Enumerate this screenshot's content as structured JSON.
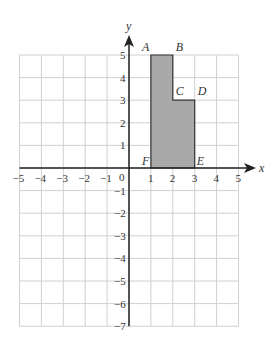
{
  "diagram": {
    "type": "coordinate-grid",
    "x_axis": {
      "label": "x",
      "min": -5,
      "max": 5,
      "ticks": [
        "-5",
        "-4",
        "-3",
        "-2",
        "-1",
        "1",
        "2",
        "3",
        "4",
        "5"
      ]
    },
    "y_axis": {
      "label": "y",
      "min": -7,
      "max": 5,
      "ticks": [
        "5",
        "4",
        "3",
        "2",
        "1",
        "-1",
        "-2",
        "-3",
        "-4",
        "-5",
        "-6",
        "-7"
      ]
    },
    "origin_label": "0",
    "shape": {
      "name": "L-shaped polygon ABCDEF",
      "fill": "#a9a9a9",
      "stroke": "#333333",
      "vertices": [
        {
          "label": "A",
          "x": 1,
          "y": 5
        },
        {
          "label": "B",
          "x": 2,
          "y": 5
        },
        {
          "label": "C",
          "x": 2,
          "y": 3
        },
        {
          "label": "D",
          "x": 3,
          "y": 3
        },
        {
          "label": "E",
          "x": 3,
          "y": 0
        },
        {
          "label": "F",
          "x": 1,
          "y": 0
        }
      ]
    },
    "colors": {
      "grid": "#d0d0d0",
      "axis": "#222222",
      "text": "#333333"
    }
  }
}
